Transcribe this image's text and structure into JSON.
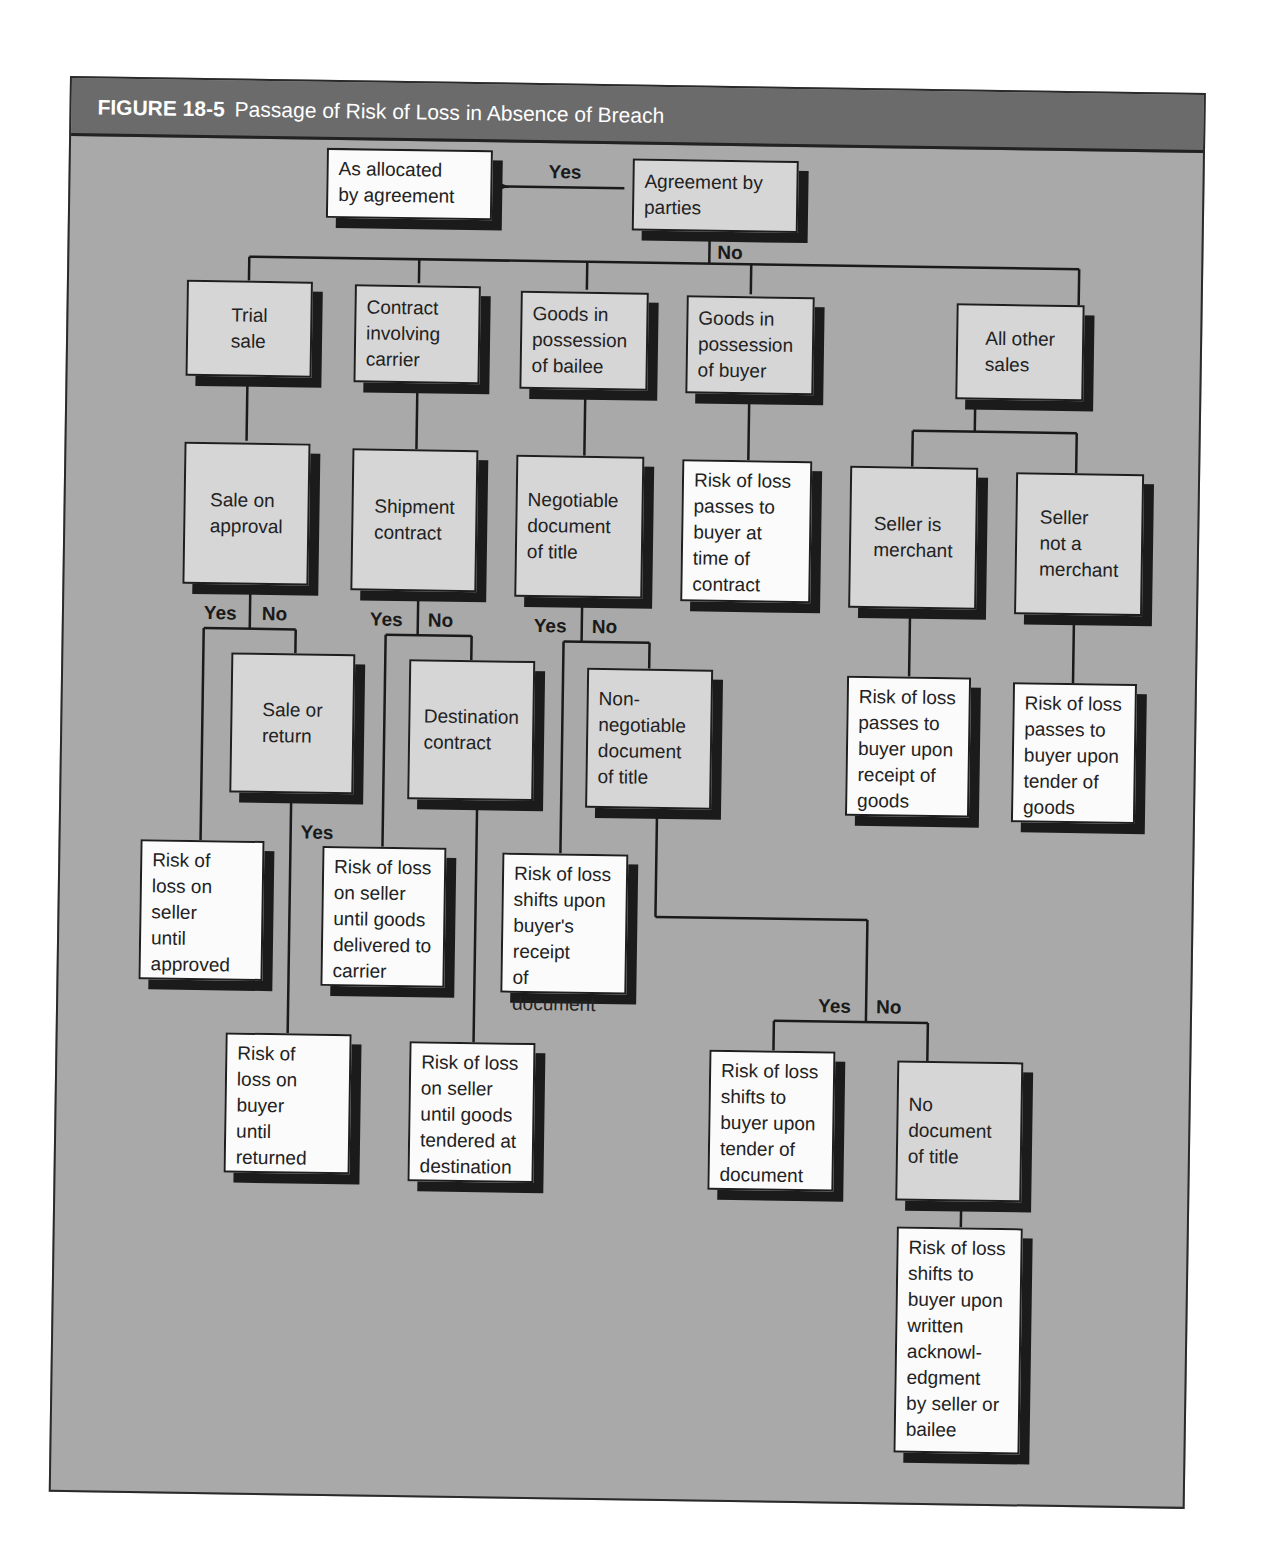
{
  "figure": {
    "number": "FIGURE 18-5",
    "title": "Passage of Risk of Loss in Absence of Breach"
  },
  "colors": {
    "panel_bg": "#a9a9a9",
    "header_bg": "#6b6b6b",
    "decision_box": "#d6d6d6",
    "outcome_box": "#fbfbfb",
    "shadow": "#1b1b1b"
  },
  "nodes": {
    "agreement": "Agreement by\nparties",
    "allocated": "As allocated\nby agreement",
    "trial_sale": "Trial\nsale",
    "carrier": "Contract\ninvolving\ncarrier",
    "bailee": "Goods in\npossession\nof bailee",
    "buyer_possession": "Goods in\npossession\nof buyer",
    "all_other": "All other\nsales",
    "sale_on_approval": "Sale on\napproval",
    "shipment": "Shipment\ncontract",
    "negotiable": "Negotiable\ndocument\nof title",
    "buyer_time_contract": "Risk of loss\npasses to\nbuyer at\ntime of\ncontract",
    "seller_merchant": "Seller is\nmerchant",
    "seller_not_merchant": "Seller\nnot a\nmerchant",
    "sale_or_return": "Sale or\nreturn",
    "destination": "Destination\ncontract",
    "non_negotiable": "Non-\nnegotiable\ndocument\nof title",
    "receipt_goods": "Risk of loss\npasses to\nbuyer upon\nreceipt of\ngoods",
    "tender_goods": "Risk of loss\npasses to\nbuyer upon\ntender of\ngoods",
    "seller_until_approved": "Risk of\nloss on\nseller\nuntil\napproved",
    "seller_until_carrier": "Risk of loss\non seller\nuntil goods\ndelivered to\ncarrier",
    "buyer_receipt_document": "Risk of loss\nshifts upon\nbuyer's\nreceipt\nof document",
    "buyer_until_returned": "Risk of\nloss on\nbuyer\nuntil\nreturned",
    "seller_until_destination": "Risk of loss\non seller\nuntil goods\ntendered at\ndestination",
    "tender_document": "Risk of loss\nshifts to\nbuyer upon\ntender of\ndocument",
    "no_document": "No\ndocument\nof title",
    "written_ack": "Risk of loss\nshifts to\nbuyer upon\nwritten\nacknowl-\nedgment\nby seller or\nbailee"
  },
  "labels": {
    "yes": "Yes",
    "no": "No"
  }
}
